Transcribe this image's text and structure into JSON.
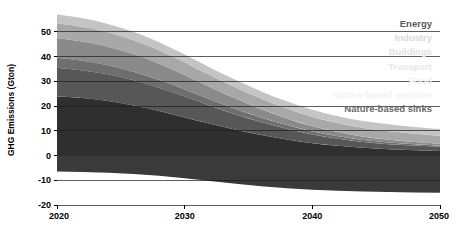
{
  "chart_data": {
    "type": "area",
    "stacked": true,
    "title": "",
    "subtitle": "",
    "xlabel": "",
    "ylabel": "GHG Emissions (Gton)",
    "x": [
      2020,
      2022,
      2024,
      2026,
      2028,
      2030,
      2032,
      2034,
      2036,
      2038,
      2040,
      2042,
      2044,
      2046,
      2048,
      2050
    ],
    "xlim": [
      2020,
      2050
    ],
    "ylim": [
      -20,
      58
    ],
    "xticks": [
      2020,
      2030,
      2040,
      2050
    ],
    "xtick_labels": [
      "2020",
      "2030",
      "2040",
      "2050"
    ],
    "yticks": [
      -20,
      -10,
      0,
      10,
      20,
      30,
      40,
      50
    ],
    "ytick_labels": [
      "-20",
      "-10",
      "0",
      "10",
      "20",
      "30",
      "40",
      "50"
    ],
    "grid": true,
    "grid_axis": "y",
    "legend_position": "top-right-inside",
    "series": [
      {
        "name": "Energy",
        "color": "#2f2f2f",
        "legend_text_color": "#5a5a5a",
        "values": [
          24.0,
          23.2,
          22.0,
          20.2,
          18.0,
          15.4,
          12.8,
          10.4,
          8.3,
          6.5,
          5.0,
          3.9,
          3.1,
          2.5,
          2.1,
          1.8
        ]
      },
      {
        "name": "Industry",
        "color": "#575757",
        "legend_text_color": "#d8d8d8",
        "values": [
          11.5,
          11.2,
          10.8,
          10.2,
          9.4,
          8.4,
          7.3,
          6.2,
          5.2,
          4.3,
          3.5,
          2.9,
          2.4,
          2.1,
          1.9,
          1.7
        ]
      },
      {
        "name": "Buildings",
        "color": "#6e6e6e",
        "legend_text_color": "#e2e2e2",
        "values": [
          4.0,
          3.9,
          3.7,
          3.5,
          3.2,
          2.9,
          2.5,
          2.2,
          1.8,
          1.5,
          1.2,
          1.0,
          0.8,
          0.7,
          0.6,
          0.5
        ]
      },
      {
        "name": "Transport",
        "color": "#8a8a8a",
        "legend_text_color": "#e8e8e8",
        "values": [
          8.0,
          7.8,
          7.5,
          7.1,
          6.5,
          5.8,
          5.0,
          4.2,
          3.4,
          2.7,
          2.1,
          1.7,
          1.3,
          1.1,
          0.9,
          0.8
        ]
      },
      {
        "name": "Food",
        "color": "#a8a8a8",
        "legend_text_color": "#f0f0f0",
        "values": [
          6.0,
          5.9,
          5.8,
          5.6,
          5.4,
          5.1,
          4.8,
          4.5,
          4.2,
          4.0,
          3.8,
          3.6,
          3.5,
          3.4,
          3.3,
          3.2
        ]
      },
      {
        "name": "Nature-based sources",
        "color": "#c4c4c4",
        "legend_text_color": "#f2f2f2",
        "values": [
          3.5,
          3.5,
          3.4,
          3.4,
          3.3,
          3.2,
          3.1,
          3.0,
          3.0,
          2.9,
          2.9,
          2.8,
          2.8,
          2.8,
          2.7,
          2.7
        ]
      },
      {
        "name": "Nature-based sinks",
        "color": "#3a3a3a",
        "legend_text_color": "#6a6a6a",
        "values": [
          -6.5,
          -6.7,
          -7.0,
          -7.5,
          -8.2,
          -9.2,
          -10.3,
          -11.4,
          -12.4,
          -13.2,
          -13.8,
          -14.2,
          -14.5,
          -14.7,
          -14.9,
          -15.0
        ]
      }
    ],
    "plot_background": "#ffffff",
    "gridline_color": "#1a1a1a"
  },
  "axes": {
    "ylabel": "GHG Emissions (Gton)"
  },
  "legend": {
    "items": [
      {
        "label": "Energy"
      },
      {
        "label": "Industry"
      },
      {
        "label": "Buildings"
      },
      {
        "label": "Transport"
      },
      {
        "label": "Food"
      },
      {
        "label": "Nature-based sources"
      },
      {
        "label": "Nature-based sinks"
      }
    ]
  }
}
